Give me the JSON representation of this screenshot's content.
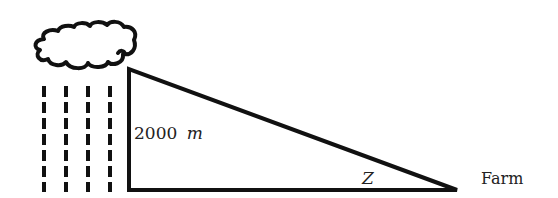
{
  "diagram": {
    "type": "right-triangle-elevation",
    "labels": {
      "height": "2000",
      "height_unit": "m",
      "angle": "Z",
      "endpoint": "Farm"
    },
    "elements": [
      "cloud",
      "rain",
      "triangle"
    ],
    "colors": {
      "stroke": "#111111",
      "text": "#222222",
      "background": "#ffffff"
    }
  }
}
